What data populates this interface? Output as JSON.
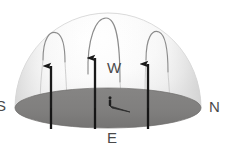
{
  "figure": {
    "type": "diagram",
    "background_color": "#ffffff"
  },
  "dome": {
    "name": "sky-dome",
    "fill_top_color": "#fdfdfd",
    "fill_edge_color": "#e2e2e2",
    "outline_color": "#d8d8d8",
    "center_x": 108,
    "center_y": 108,
    "radius_x": 93,
    "radius_y": 95
  },
  "ground": {
    "name": "ground-ellipse",
    "fill_color": "#807f7e",
    "edge_color": "#6e6d6c",
    "center_x": 108,
    "center_y": 108,
    "radius_x": 93,
    "radius_y": 20
  },
  "cardinals": [
    {
      "id": "south",
      "label": "S",
      "position": "left",
      "color": "#4a4a4a"
    },
    {
      "id": "north",
      "label": "N",
      "position": "right",
      "color": "#4a4a4a"
    },
    {
      "id": "west",
      "label": "W",
      "position": "upper-center",
      "color": "#4a4a4a"
    },
    {
      "id": "east",
      "label": "E",
      "position": "bottom-center",
      "color": "#4a4a4a"
    }
  ],
  "field_arrows": {
    "description": "thick vertical upward arrows rising from the ground plane",
    "color": "#1a1a1a",
    "count": 3,
    "items": [
      {
        "id": "arrow-left",
        "base_x": 51,
        "base_y": 128,
        "tip_y": 66
      },
      {
        "id": "arrow-center",
        "base_x": 95,
        "base_y": 128,
        "tip_y": 58
      },
      {
        "id": "arrow-right",
        "base_x": 148,
        "base_y": 128,
        "tip_y": 64
      }
    ]
  },
  "field_lines": {
    "description": "thin curved arcs looping over the top of the dome",
    "color": "#8c8c8c",
    "count": 3,
    "items": [
      {
        "id": "arc-left",
        "apex_x": 54,
        "apex_y": 35
      },
      {
        "id": "arc-center",
        "apex_x": 105,
        "apex_y": 18
      },
      {
        "id": "arc-right",
        "apex_x": 157,
        "apex_y": 33
      }
    ]
  },
  "observer": {
    "name": "observer-figure",
    "x": 110,
    "y": 100,
    "color": "#1d1d1d",
    "shadow": {
      "name": "observer-shadow",
      "color": "#2b2b2b",
      "direction": "lower-right",
      "length": 22
    }
  }
}
